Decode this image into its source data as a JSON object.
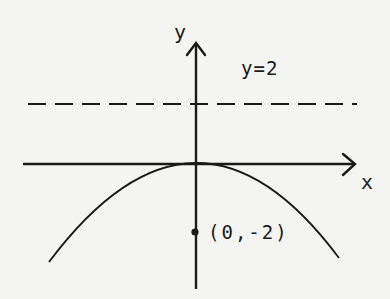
{
  "diagram": {
    "type": "parabola-focus-directrix",
    "equation_implied": "x^2 = -8y",
    "vertex": [
      0,
      0
    ],
    "focus": [
      0,
      -2
    ],
    "directrix": "y = 2",
    "opens": "down"
  },
  "labels": {
    "x_axis": "x",
    "y_axis": "y",
    "directrix": "y=2",
    "focus_point": "(0,-2)"
  },
  "style": {
    "ink": "#1a1a1a",
    "background": "#f4f4f2"
  }
}
